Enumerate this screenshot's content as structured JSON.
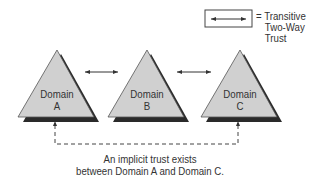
{
  "legend": {
    "symbol": "double-headed-arrow",
    "equals": "=",
    "lines": [
      "Transitive",
      "Two-Way",
      "Trust"
    ]
  },
  "domains": [
    {
      "name": "Domain",
      "letter": "A"
    },
    {
      "name": "Domain",
      "letter": "B"
    },
    {
      "name": "Domain",
      "letter": "C"
    }
  ],
  "trusts": [
    {
      "from": "A",
      "to": "B",
      "type": "Transitive Two-Way Trust"
    },
    {
      "from": "B",
      "to": "C",
      "type": "Transitive Two-Way Trust"
    },
    {
      "from": "A",
      "to": "C",
      "type": "implicit",
      "style": "dashed"
    }
  ],
  "caption": {
    "line1": "An implicit trust exists",
    "line2": "between Domain A and Domain C."
  },
  "colors": {
    "triangle_fill": "#d0d0d0",
    "triangle_shadow": "#2a2a2a",
    "line": "#333333"
  }
}
